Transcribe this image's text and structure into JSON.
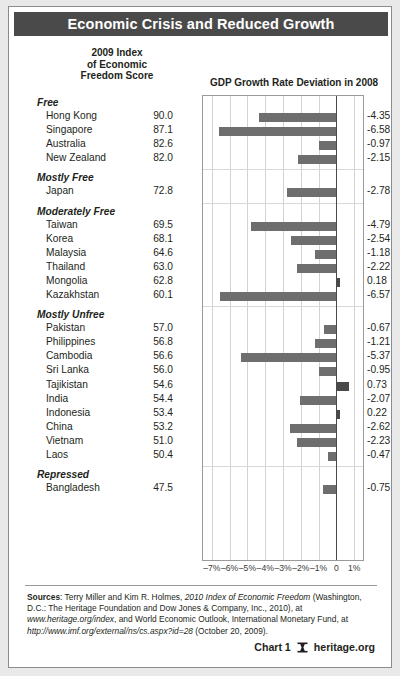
{
  "title": "Economic Crisis and Reduced Growth",
  "headers": {
    "score": "2009 Index\nof Economic\nFreedom Score",
    "score_line1": "2009 Index",
    "score_line2": "of Economic",
    "score_line3": "Freedom Score",
    "gdp": "GDP Growth Rate Deviation in 2008"
  },
  "footer": {
    "sources_label": "Sources",
    "sources_text_1": ": Terry Miller and Kim R. Holmes, ",
    "sources_italic_1": "2010 Index of Economic Freedom",
    "sources_text_2": " (Washington, D.C.: The Heritage Foundation and Dow Jones & Company, Inc., 2010), at ",
    "sources_italic_2": "www.heritage.org/index",
    "sources_text_3": ", and World Economic Outlook, International Monetary Fund, at ",
    "sources_italic_3": "http://www.imf.org/external/ns/cs.aspx?id=28",
    "sources_text_4": " (October 20, 2009).",
    "chart_number": "Chart 1",
    "brand": "heritage.org",
    "logo_icon": "heritage-foundation-logo-icon"
  },
  "chart_data": {
    "type": "bar",
    "title": "GDP Growth Rate Deviation in 2008",
    "xlabel": "",
    "ylabel": "",
    "orientation": "horizontal",
    "xlim": [
      -7.5,
      1.5
    ],
    "xticks": [
      -7,
      -6,
      -5,
      -4,
      -3,
      -2,
      -1,
      0,
      1
    ],
    "xtick_labels": [
      "–7%",
      "–6%",
      "–5%",
      "–4%",
      "–3%",
      "–2%",
      "–1%",
      "0",
      "1%"
    ],
    "grid": "vertical",
    "legend": "none",
    "series_name": "GDP Growth Rate Deviation in 2008",
    "score_series_name": "2009 Index of Economic Freedom Score",
    "bar_color": "#6e6e6e",
    "positive_bar_color": "#4a4a4a",
    "groups": [
      {
        "label": "Free",
        "rows": [
          {
            "country": "Hong Kong",
            "score": "90.0",
            "score_value": 90.0,
            "deviation": "-4.35",
            "deviation_value": -4.35
          },
          {
            "country": "Singapore",
            "score": "87.1",
            "score_value": 87.1,
            "deviation": "-6.58",
            "deviation_value": -6.58
          },
          {
            "country": "Australia",
            "score": "82.6",
            "score_value": 82.6,
            "deviation": "-0.97",
            "deviation_value": -0.97
          },
          {
            "country": "New Zealand",
            "score": "82.0",
            "score_value": 82.0,
            "deviation": "-2.15",
            "deviation_value": -2.15
          }
        ]
      },
      {
        "label": "Mostly Free",
        "rows": [
          {
            "country": "Japan",
            "score": "72.8",
            "score_value": 72.8,
            "deviation": "-2.78",
            "deviation_value": -2.78
          }
        ]
      },
      {
        "label": "Moderately Free",
        "rows": [
          {
            "country": "Taiwan",
            "score": "69.5",
            "score_value": 69.5,
            "deviation": "-4.79",
            "deviation_value": -4.79
          },
          {
            "country": "Korea",
            "score": "68.1",
            "score_value": 68.1,
            "deviation": "-2.54",
            "deviation_value": -2.54
          },
          {
            "country": "Malaysia",
            "score": "64.6",
            "score_value": 64.6,
            "deviation": "-1.18",
            "deviation_value": -1.18
          },
          {
            "country": "Thailand",
            "score": "63.0",
            "score_value": 63.0,
            "deviation": "-2.22",
            "deviation_value": -2.22
          },
          {
            "country": "Mongolia",
            "score": "62.8",
            "score_value": 62.8,
            "deviation": "0.18",
            "deviation_value": 0.18
          },
          {
            "country": "Kazakhstan",
            "score": "60.1",
            "score_value": 60.1,
            "deviation": "-6.57",
            "deviation_value": -6.57
          }
        ]
      },
      {
        "label": "Mostly Unfree",
        "rows": [
          {
            "country": "Pakistan",
            "score": "57.0",
            "score_value": 57.0,
            "deviation": "-0.67",
            "deviation_value": -0.67
          },
          {
            "country": "Philippines",
            "score": "56.8",
            "score_value": 56.8,
            "deviation": "-1.21",
            "deviation_value": -1.21
          },
          {
            "country": "Cambodia",
            "score": "56.6",
            "score_value": 56.6,
            "deviation": "-5.37",
            "deviation_value": -5.37
          },
          {
            "country": "Sri Lanka",
            "score": "56.0",
            "score_value": 56.0,
            "deviation": "-0.95",
            "deviation_value": -0.95
          },
          {
            "country": "Tajikistan",
            "score": "54.6",
            "score_value": 54.6,
            "deviation": "0.73",
            "deviation_value": 0.73
          },
          {
            "country": "India",
            "score": "54.4",
            "score_value": 54.4,
            "deviation": "-2.07",
            "deviation_value": -2.07
          },
          {
            "country": "Indonesia",
            "score": "53.4",
            "score_value": 53.4,
            "deviation": "0.22",
            "deviation_value": 0.22
          },
          {
            "country": "China",
            "score": "53.2",
            "score_value": 53.2,
            "deviation": "-2.62",
            "deviation_value": -2.62
          },
          {
            "country": "Vietnam",
            "score": "51.0",
            "score_value": 51.0,
            "deviation": "-2.23",
            "deviation_value": -2.23
          },
          {
            "country": "Laos",
            "score": "50.4",
            "score_value": 50.4,
            "deviation": "-0.47",
            "deviation_value": -0.47
          }
        ]
      },
      {
        "label": "Repressed",
        "rows": [
          {
            "country": "Bangladesh",
            "score": "47.5",
            "score_value": 47.5,
            "deviation": "-0.75",
            "deviation_value": -0.75
          }
        ]
      }
    ]
  }
}
